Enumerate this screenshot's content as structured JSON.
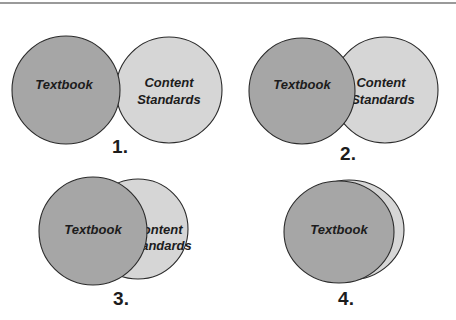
{
  "figure": {
    "colors": {
      "textbook_fill": "#a6a6a6",
      "standards_fill": "#d6d6d6",
      "outline": "#2b2b2b",
      "text": "#1c1c1c",
      "top_rule": "#9a9a9a"
    },
    "diagrams": [
      {
        "number": "1.",
        "textbook_label": "Textbook",
        "standards_label_line1": "Content",
        "standards_label_line2": "Standards",
        "overlap": "minimal"
      },
      {
        "number": "2.",
        "textbook_label": "Textbook",
        "standards_label_line1": "Content",
        "standards_label_line2": "Standards",
        "overlap": "partial"
      },
      {
        "number": "3.",
        "textbook_label": "Textbook",
        "standards_label_line1": "Content",
        "standards_label_line2": "Standards",
        "overlap": "substantial"
      },
      {
        "number": "4.",
        "textbook_label": "Textbook",
        "overlap": "near-complete"
      }
    ]
  }
}
